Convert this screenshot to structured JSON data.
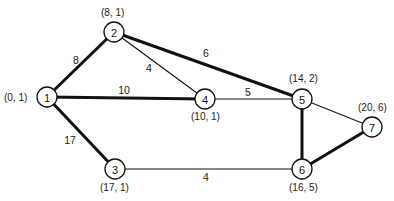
{
  "diagram": {
    "type": "weighted-graph-shortest-path",
    "nodes": [
      {
        "id": "1",
        "x": 47,
        "y": 97,
        "label": "(0, 1)",
        "lx": 4,
        "ly": 101
      },
      {
        "id": "2",
        "x": 114,
        "y": 32,
        "label": "(8, 1)",
        "lx": 101,
        "ly": 16
      },
      {
        "id": "3",
        "x": 115,
        "y": 169,
        "label": "(17, 1)",
        "lx": 100,
        "ly": 191
      },
      {
        "id": "4",
        "x": 205,
        "y": 99,
        "label": "(10, 1)",
        "lx": 191,
        "ly": 120
      },
      {
        "id": "5",
        "x": 302,
        "y": 99,
        "label": "(14, 2)",
        "lx": 289,
        "ly": 82
      },
      {
        "id": "6",
        "x": 302,
        "y": 169,
        "label": "(16, 5)",
        "lx": 289,
        "ly": 191
      },
      {
        "id": "7",
        "x": 372,
        "y": 127,
        "label": "(20, 6)",
        "lx": 358,
        "ly": 111
      }
    ],
    "edges": [
      {
        "from": "1",
        "to": "2",
        "weight": "8",
        "bold": true,
        "wx": 76,
        "wy": 64
      },
      {
        "from": "1",
        "to": "4",
        "weight": "10",
        "bold": true,
        "wx": 124,
        "wy": 94
      },
      {
        "from": "1",
        "to": "3",
        "weight": "17",
        "bold": true,
        "wx": 70,
        "wy": 144
      },
      {
        "from": "2",
        "to": "4",
        "weight": "4",
        "bold": false,
        "wx": 149,
        "wy": 72
      },
      {
        "from": "2",
        "to": "5",
        "weight": "6",
        "bold": true,
        "wx": 206,
        "wy": 57
      },
      {
        "from": "4",
        "to": "5",
        "weight": "5",
        "bold": false,
        "wx": 248,
        "wy": 96
      },
      {
        "from": "3",
        "to": "6",
        "weight": "4",
        "bold": false,
        "wx": 206,
        "wy": 181
      },
      {
        "from": "5",
        "to": "6",
        "weight": "",
        "bold": true,
        "wx": 0,
        "wy": 0
      },
      {
        "from": "5",
        "to": "7",
        "weight": "",
        "bold": false,
        "wx": 0,
        "wy": 0
      },
      {
        "from": "6",
        "to": "7",
        "weight": "",
        "bold": true,
        "wx": 0,
        "wy": 0
      }
    ]
  }
}
